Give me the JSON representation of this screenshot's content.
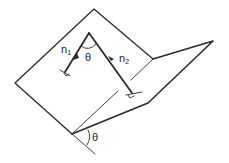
{
  "diagram": {
    "labels": {
      "n1": {
        "base": "n",
        "sub": "1"
      },
      "n2": {
        "base": "n",
        "sub": "2"
      },
      "theta_between_normals": "θ",
      "theta_dihedral": "θ"
    },
    "colors": {
      "line": "#2a2a2a",
      "background": "#ffffff"
    }
  }
}
